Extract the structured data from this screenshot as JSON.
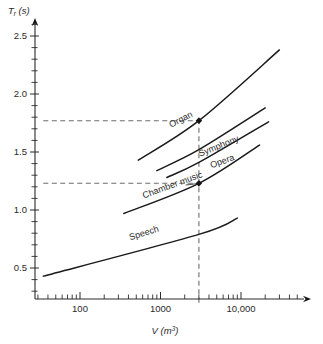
{
  "chart_data": {
    "type": "line",
    "title": "",
    "xlabel": "V (m³)",
    "ylabel": "Tr (s)",
    "xscale": "log",
    "yscale": "linear",
    "xlim": [
      30,
      60000
    ],
    "ylim": [
      0.18,
      2.72
    ],
    "grid": false,
    "legend": "inline-labels",
    "ytick_labels": [
      "0.5",
      "1.0",
      "1.5",
      "2.0",
      "2.5"
    ],
    "ytick_values": [
      0.5,
      1.0,
      1.5,
      2.0,
      2.5
    ],
    "xtick_labels": [
      "100",
      "1000",
      "10,000"
    ],
    "xtick_values": [
      100,
      1000,
      10000
    ],
    "series": [
      {
        "name": "Organ",
        "label": "Organ",
        "points": [
          [
            530,
            1.43
          ],
          [
            3000,
            1.77
          ],
          [
            30000,
            2.38
          ]
        ]
      },
      {
        "name": "Symphony",
        "label": "Symphony",
        "points": [
          [
            900,
            1.34
          ],
          [
            3000,
            1.52
          ],
          [
            20000,
            1.88
          ]
        ]
      },
      {
        "name": "Opera",
        "label": "Opera",
        "points": [
          [
            1200,
            1.28
          ],
          [
            3000,
            1.41
          ],
          [
            22000,
            1.76
          ]
        ]
      },
      {
        "name": "Chamber music",
        "label": "Chamber music",
        "points": [
          [
            350,
            0.97
          ],
          [
            3000,
            1.23
          ],
          [
            17000,
            1.56
          ]
        ]
      },
      {
        "name": "Speech",
        "label": "Speech",
        "points": [
          [
            35,
            0.43
          ],
          [
            3000,
            0.79
          ],
          [
            9000,
            0.93
          ]
        ]
      }
    ],
    "reference_lines": [
      {
        "type": "horizontal",
        "value": 1.77,
        "style": "dashed",
        "from_x": 35,
        "to_x": 3000
      },
      {
        "type": "horizontal",
        "value": 1.23,
        "style": "dashed",
        "from_x": 35,
        "to_x": 3000
      },
      {
        "type": "vertical",
        "value": 3000,
        "style": "dashed",
        "from_y": 0.2,
        "to_y": 1.77
      }
    ],
    "markers": [
      {
        "x": 3000,
        "y": 1.77,
        "series": "Organ"
      },
      {
        "x": 3000,
        "y": 1.23,
        "series": "Chamber music"
      }
    ],
    "annotations": [
      {
        "text": "Organ",
        "x": 1350,
        "y": 1.71,
        "rotation": -27
      },
      {
        "text": "Symphony",
        "x": 3100,
        "y": 1.46,
        "rotation": -22
      },
      {
        "text": "Opera",
        "x": 4300,
        "y": 1.36,
        "rotation": -20
      },
      {
        "text": "Chamber music",
        "x": 620,
        "y": 1.1,
        "rotation": -20
      },
      {
        "text": "Speech",
        "x": 420,
        "y": 0.74,
        "rotation": -17
      }
    ]
  }
}
